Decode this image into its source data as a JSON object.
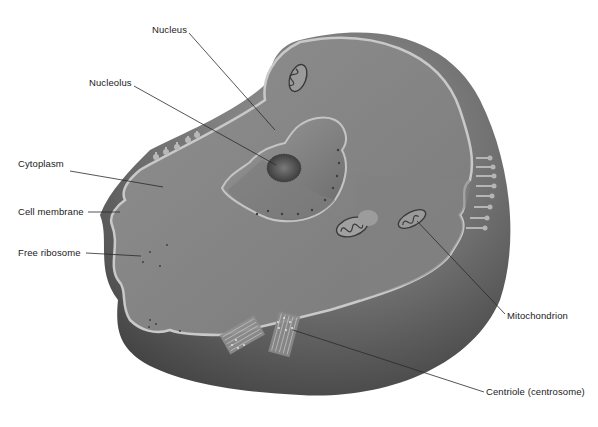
{
  "diagram": {
    "labels": [
      {
        "id": "nucleus",
        "text": "Nucleus",
        "x": 152,
        "y": 24
      },
      {
        "id": "nucleolus",
        "text": "Nucleolus",
        "x": 89,
        "y": 77
      },
      {
        "id": "cytoplasm",
        "text": "Cytoplasm",
        "x": 18,
        "y": 158
      },
      {
        "id": "cell-membrane",
        "text": "Cell membrane",
        "x": 18,
        "y": 206
      },
      {
        "id": "free-ribosome",
        "text": "Free ribosome",
        "x": 18,
        "y": 247
      },
      {
        "id": "mitochondrion",
        "text": "Mitochondrion",
        "x": 507,
        "y": 310
      },
      {
        "id": "centriole",
        "text": "Centriole (centrosome)",
        "x": 486,
        "y": 386
      }
    ],
    "colors": {
      "background": "#ffffff",
      "cytoplasm": "#8a8a8a",
      "cut_face": "#7d7d7d",
      "outer_shell": "#5a5a5a",
      "membrane": "#c9c9c9",
      "label_text": "#1a1a1a",
      "leader_line": "#2a2a2a"
    }
  }
}
